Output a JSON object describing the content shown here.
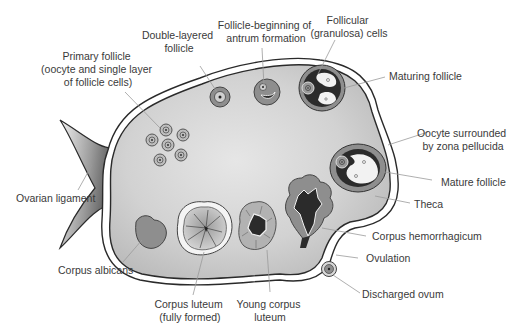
{
  "colors": {
    "ovary_fill": "#c9c9c9",
    "ovary_fill_light": "#e4e4e4",
    "outline": "#2a2a2a",
    "follicle_gray": "#8c8c8c",
    "antrum_dark": "#2b2b2b",
    "label_text": "#3a3a3a",
    "leader_line": "#9a9a9a"
  },
  "labels": {
    "primary_follicle": [
      "Primary follicle",
      "(oocyte and single layer",
      "of follicle cells)"
    ],
    "double_layered": [
      "Double-layered",
      "follicle"
    ],
    "antrum_beginning": [
      "Follicle-beginning of",
      "antrum formation"
    ],
    "granulosa": [
      "Follicular",
      "(granulosa) cells"
    ],
    "maturing": [
      "Maturing follicle"
    ],
    "zona_pellucida": [
      "Oocyte surrounded",
      "by zona pellucida"
    ],
    "mature": [
      "Mature follicle"
    ],
    "theca": [
      "Theca"
    ],
    "ligament": [
      "Ovarian ligament"
    ],
    "hemorrhagicum": [
      "Corpus hemorrhagicum"
    ],
    "ovulation": [
      "Ovulation"
    ],
    "albicans": [
      "Corpus albicans"
    ],
    "luteum_full": [
      "Corpus luteum",
      "(fully formed)"
    ],
    "luteum_young": [
      "Young corpus",
      "luteum"
    ],
    "ovum": [
      "Discharged ovum"
    ]
  }
}
